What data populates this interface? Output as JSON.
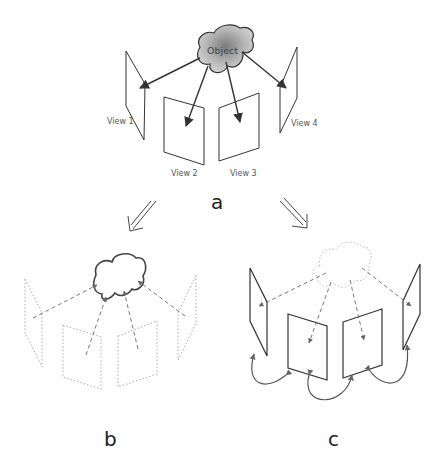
{
  "figure": {
    "panel_a": {
      "label": "a",
      "object_label": "Object",
      "views": [
        "View 1",
        "View 2",
        "View 3",
        "View 4"
      ]
    },
    "panel_b": {
      "label": "b"
    },
    "panel_c": {
      "label": "c"
    }
  },
  "colors": {
    "line": "#333333",
    "dotted": "#aaaaaa",
    "dashed": "#777777",
    "object_fill": "#9a9a9a"
  }
}
